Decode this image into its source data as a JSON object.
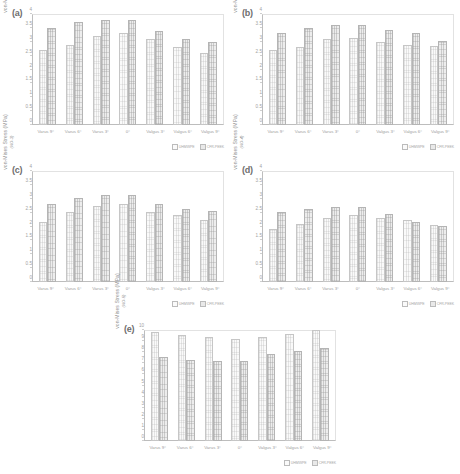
{
  "figure": {
    "categories": [
      "Varus 9°",
      "Varus 6°",
      "Varus 3°",
      "0°",
      "Valgus 3°",
      "Valgus 6°",
      "Valgus 9°"
    ],
    "legend": [
      {
        "key": "s1",
        "label": "UHMWPE",
        "color": "#fafafa"
      },
      {
        "key": "s2",
        "label": "CFR-PEEK",
        "color": "#e9e9e9"
      }
    ],
    "ylabel_main": "von-Mises Stress (MPa)"
  },
  "chart_data": [
    {
      "panel": "(a)",
      "type": "bar",
      "title": "",
      "xlabel": "",
      "ylabel": "von-Mises Stress (MPa)",
      "ylabel_sub": "(NO-1)",
      "ylim": [
        0,
        4
      ],
      "yticks": [
        0,
        0.5,
        1,
        1.5,
        2,
        2.5,
        3,
        3.5,
        4
      ],
      "grid": false,
      "legend_position": "bottom-right",
      "categories": [
        "Varus 9°",
        "Varus 6°",
        "Varus 3°",
        "0°",
        "Valgus 3°",
        "Valgus 6°",
        "Valgus 9°"
      ],
      "series": [
        {
          "name": "UHMWPE",
          "values": [
            2.7,
            2.9,
            3.2,
            3.3,
            3.1,
            2.8,
            2.6
          ]
        },
        {
          "name": "CFR-PEEK",
          "values": [
            3.5,
            3.7,
            3.8,
            3.8,
            3.4,
            3.1,
            3.0
          ]
        }
      ]
    },
    {
      "panel": "(b)",
      "type": "bar",
      "title": "",
      "xlabel": "",
      "ylabel": "von-Mises Stress (MPa)",
      "ylabel_sub": "(NO-2)",
      "ylim": [
        0,
        4
      ],
      "yticks": [
        0,
        0.5,
        1,
        1.5,
        2,
        2.5,
        3,
        3.5,
        4
      ],
      "grid": false,
      "legend_position": "bottom-right",
      "categories": [
        "Varus 9°",
        "Varus 6°",
        "Varus 3°",
        "0°",
        "Valgus 3°",
        "Valgus 6°",
        "Valgus 9°"
      ],
      "series": [
        {
          "name": "UHMWPE",
          "values": [
            2.7,
            2.8,
            3.1,
            3.15,
            3.0,
            2.9,
            2.85
          ]
        },
        {
          "name": "CFR-PEEK",
          "values": [
            3.3,
            3.5,
            3.6,
            3.62,
            3.42,
            3.3,
            3.02
          ]
        }
      ]
    },
    {
      "panel": "(c)",
      "type": "bar",
      "title": "",
      "xlabel": "",
      "ylabel": "von-Mises Stress (MPa)",
      "ylabel_sub": "(NO-3)",
      "ylim": [
        0,
        4
      ],
      "yticks": [
        0,
        0.5,
        1,
        1.5,
        2,
        2.5,
        3,
        3.5,
        4
      ],
      "grid": false,
      "legend_position": "bottom-right",
      "categories": [
        "Varus 9°",
        "Varus 6°",
        "Varus 3°",
        "0°",
        "Valgus 3°",
        "Valgus 6°",
        "Valgus 9°"
      ],
      "series": [
        {
          "name": "UHMWPE",
          "values": [
            2.18,
            2.52,
            2.75,
            2.82,
            2.52,
            2.4,
            2.22
          ]
        },
        {
          "name": "CFR-PEEK",
          "values": [
            2.82,
            3.02,
            3.12,
            3.12,
            2.82,
            2.62,
            2.55
          ]
        }
      ]
    },
    {
      "panel": "(d)",
      "type": "bar",
      "title": "",
      "xlabel": "",
      "ylabel": "von-Mises Stress (MPa)",
      "ylabel_sub": "(NO-4)",
      "ylim": [
        0,
        4
      ],
      "yticks": [
        0,
        0.5,
        1,
        1.5,
        2,
        2.5,
        3,
        3.5,
        4
      ],
      "grid": false,
      "legend_position": "bottom-right",
      "categories": [
        "Varus 9°",
        "Varus 6°",
        "Varus 3°",
        "0°",
        "Valgus 3°",
        "Valgus 6°",
        "Valgus 9°"
      ],
      "series": [
        {
          "name": "UHMWPE",
          "values": [
            1.9,
            2.1,
            2.3,
            2.42,
            2.32,
            2.22,
            2.05
          ]
        },
        {
          "name": "CFR-PEEK",
          "values": [
            2.52,
            2.62,
            2.72,
            2.72,
            2.44,
            2.15,
            2.02
          ]
        }
      ]
    },
    {
      "panel": "(e)",
      "type": "bar",
      "title": "",
      "xlabel": "",
      "ylabel": "von-Mises Stress (MPa)",
      "ylabel_sub": "(NO-5)",
      "ylim": [
        0,
        10
      ],
      "yticks": [
        0,
        1,
        2,
        3,
        4,
        5,
        6,
        7,
        8,
        9,
        10
      ],
      "grid": false,
      "legend_position": "bottom-right",
      "categories": [
        "Varus 9°",
        "Varus 6°",
        "Varus 3°",
        "0°",
        "Valgus 3°",
        "Valgus 6°",
        "Valgus 9°"
      ],
      "series": [
        {
          "name": "UHMWPE",
          "values": [
            9.85,
            9.55,
            9.35,
            9.22,
            9.4,
            9.6,
            10.0
          ]
        },
        {
          "name": "CFR-PEEK",
          "values": [
            7.55,
            7.32,
            7.22,
            7.25,
            7.85,
            8.1,
            8.4
          ]
        }
      ]
    }
  ]
}
